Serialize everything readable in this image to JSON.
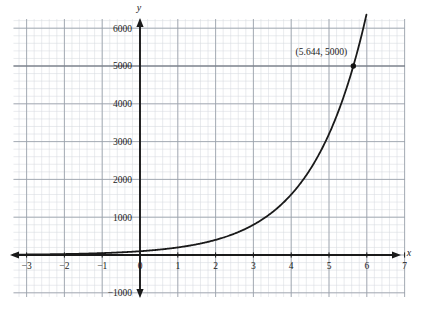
{
  "chart_data": {
    "type": "line",
    "title": "",
    "xlabel": "x",
    "ylabel": "y",
    "xlim": [
      -3.35,
      7.0
    ],
    "ylim": [
      -1200,
      6400
    ],
    "xticks": [
      -3,
      -2,
      -1,
      0,
      1,
      2,
      3,
      4,
      5,
      6,
      7
    ],
    "xtick_labels": [
      "−3",
      "−2",
      "−1",
      "0",
      "1",
      "2",
      "3",
      "4",
      "5",
      "6",
      "7"
    ],
    "yticks": [
      -1000,
      1000,
      2000,
      3000,
      4000,
      5000,
      6000
    ],
    "ytick_labels": [
      "−1000",
      "1000",
      "2000",
      "3000",
      "4000",
      "5000",
      "6000"
    ],
    "grid": true,
    "grid_major_step_x": 1,
    "grid_major_step_y": 1000,
    "grid_minor_divisions": 5,
    "legend": "none",
    "series": [
      {
        "name": "exponential-curve",
        "function": "y = 100 * e^(0.6931 x)",
        "base": 2.0,
        "coefficient": 100,
        "x": [
          -3.35,
          -3,
          -2.5,
          -2,
          -1.5,
          -1,
          -0.5,
          0,
          0.5,
          1,
          1.5,
          2,
          2.5,
          3,
          3.5,
          4,
          4.5,
          5,
          5.5,
          5.644,
          5.9
        ],
        "y": [
          9.8,
          9.8,
          17.7,
          25,
          35.4,
          50,
          70.7,
          100,
          141,
          200,
          283,
          400,
          566,
          800,
          1131,
          1600,
          2263,
          3200,
          4525,
          5000,
          5972
        ]
      }
    ],
    "annotations": [
      {
        "name": "point-label",
        "text": "(5.644, 5000)",
        "point_x": 5.644,
        "point_y": 5000,
        "marker": "filled-circle"
      }
    ],
    "reference_lines": [
      {
        "name": "y-5000-gridline",
        "orientation": "horizontal",
        "value": 5000
      }
    ],
    "colors": {
      "curve": "#1a1a1a",
      "axis": "#1a1a1a",
      "grid_major": "#9aa0aa",
      "grid_minor": "#d6dae0",
      "marker": "#111111",
      "background": "#ffffff"
    }
  },
  "axes": {
    "x_axis_name": "x",
    "y_axis_name": "y"
  }
}
